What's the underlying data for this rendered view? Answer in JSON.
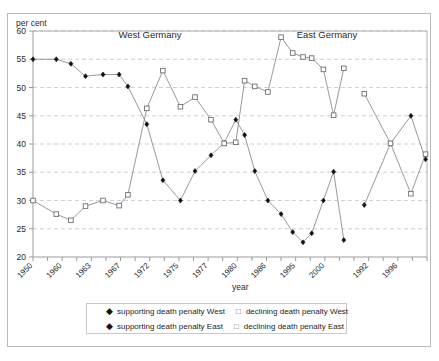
{
  "figure": {
    "y_unit_label": "per cent",
    "x_axis_title": "year",
    "panel_labels": [
      {
        "text": "West Germany",
        "x": 150,
        "y": 38
      },
      {
        "text": "East Germany",
        "x": 327,
        "y": 38
      }
    ]
  },
  "legend": {
    "rows": [
      [
        {
          "marker": "filled-diamond",
          "label": "supporting death penalty West"
        },
        {
          "marker": "open-square",
          "label": "declining death penalty West"
        }
      ],
      [
        {
          "marker": "filled-diamond",
          "label": "supporting death penalty East"
        },
        {
          "marker": "open-square",
          "label": "declining death penalty East"
        }
      ]
    ]
  },
  "colors": {
    "frame": "#b9b9b9",
    "axis": "#9a9a9a",
    "grid": "#b9c4d6",
    "line": "#8d8d8d",
    "filled_marker": "#111111",
    "open_marker_stroke": "#6f6f6f",
    "text": "#2b2b2b"
  },
  "chart_data": {
    "type": "line",
    "title": "",
    "xlabel": "year",
    "ylabel": "per cent",
    "ylim": [
      20,
      60
    ],
    "ytick_values": [
      20,
      25,
      30,
      35,
      40,
      45,
      50,
      55,
      60
    ],
    "grid": true,
    "legend_position": "bottom",
    "xtick_labels": [
      "1950",
      "1960",
      "1963",
      "1967",
      "1972",
      "1975",
      "1977",
      "1980",
      "1986",
      "1995",
      "2000",
      "1992",
      "1996"
    ],
    "xtick_slots": [
      0,
      2,
      4,
      6,
      8,
      10,
      12,
      14,
      16,
      18,
      20,
      23,
      25
    ],
    "n_slots": 28,
    "panel_split_slot": 21.5,
    "series": [
      {
        "name": "supporting death penalty West",
        "marker": "filled-diamond",
        "points": [
          {
            "slot": 0,
            "x": "1950",
            "y": 55
          },
          {
            "slot": 1.6,
            "x": "1958",
            "y": 55
          },
          {
            "slot": 2.6,
            "x": "1962",
            "y": 54.2
          },
          {
            "slot": 3.6,
            "x": "1964",
            "y": 52
          },
          {
            "slot": 4.8,
            "x": "1966",
            "y": 52.3
          },
          {
            "slot": 5.9,
            "x": "1967",
            "y": 52.3
          },
          {
            "slot": 6.5,
            "x": "1969",
            "y": 50.2
          },
          {
            "slot": 7.8,
            "x": "1971",
            "y": 43.5
          },
          {
            "slot": 8.9,
            "x": "1973",
            "y": 33.6
          },
          {
            "slot": 10.1,
            "x": "1975",
            "y": 30
          },
          {
            "slot": 11.1,
            "x": "1976",
            "y": 35.2
          },
          {
            "slot": 12.2,
            "x": "1977",
            "y": 38
          },
          {
            "slot": 13.1,
            "x": "1979",
            "y": 40.2
          },
          {
            "slot": 13.9,
            "x": "1980",
            "y": 44.3
          },
          {
            "slot": 14.5,
            "x": "1982",
            "y": 41.6
          },
          {
            "slot": 15.2,
            "x": "1984",
            "y": 35.2
          },
          {
            "slot": 16.1,
            "x": "1986",
            "y": 30
          },
          {
            "slot": 17.0,
            "x": "1989",
            "y": 27.6
          },
          {
            "slot": 17.8,
            "x": "1992",
            "y": 24.4
          },
          {
            "slot": 18.5,
            "x": "1995",
            "y": 22.6
          },
          {
            "slot": 19.1,
            "x": "1997",
            "y": 24.2
          },
          {
            "slot": 19.9,
            "x": "1998",
            "y": 30
          },
          {
            "slot": 20.6,
            "x": "2000",
            "y": 35.1
          },
          {
            "slot": 21.3,
            "x": "2002",
            "y": 23
          }
        ]
      },
      {
        "name": "declining death penalty West",
        "marker": "open-square",
        "points": [
          {
            "slot": 0,
            "x": "1950",
            "y": 30
          },
          {
            "slot": 1.6,
            "x": "1958",
            "y": 27.6
          },
          {
            "slot": 2.6,
            "x": "1962",
            "y": 26.5
          },
          {
            "slot": 3.6,
            "x": "1964",
            "y": 29
          },
          {
            "slot": 4.8,
            "x": "1966",
            "y": 30
          },
          {
            "slot": 5.9,
            "x": "1967",
            "y": 29.1
          },
          {
            "slot": 6.5,
            "x": "1969",
            "y": 31
          },
          {
            "slot": 7.8,
            "x": "1971",
            "y": 46.3
          },
          {
            "slot": 8.9,
            "x": "1973",
            "y": 53
          },
          {
            "slot": 10.1,
            "x": "1975",
            "y": 46.6
          },
          {
            "slot": 11.1,
            "x": "1976",
            "y": 48.3
          },
          {
            "slot": 12.2,
            "x": "1977",
            "y": 44.3
          },
          {
            "slot": 13.1,
            "x": "1979",
            "y": 40.1
          },
          {
            "slot": 13.9,
            "x": "1980",
            "y": 40.3
          },
          {
            "slot": 14.5,
            "x": "1982",
            "y": 51.2
          },
          {
            "slot": 15.2,
            "x": "1984",
            "y": 50.2
          },
          {
            "slot": 16.1,
            "x": "1986",
            "y": 49.2
          },
          {
            "slot": 17.0,
            "x": "1989",
            "y": 58.9
          },
          {
            "slot": 17.8,
            "x": "1992",
            "y": 56.1
          },
          {
            "slot": 18.5,
            "x": "1995",
            "y": 55.4
          },
          {
            "slot": 19.1,
            "x": "1997",
            "y": 55.2
          },
          {
            "slot": 19.9,
            "x": "1998",
            "y": 53.2
          },
          {
            "slot": 20.6,
            "x": "2000",
            "y": 45.1
          },
          {
            "slot": 21.3,
            "x": "2002",
            "y": 53.4
          }
        ]
      },
      {
        "name": "supporting death penalty East",
        "marker": "filled-diamond",
        "points": [
          {
            "slot": 22.7,
            "x": "1992",
            "y": 29.2
          },
          {
            "slot": 24.5,
            "x": "1995",
            "y": 40.1
          },
          {
            "slot": 25.9,
            "x": "1996",
            "y": 45
          },
          {
            "slot": 26.9,
            "x": "1998",
            "y": 37.3
          }
        ]
      },
      {
        "name": "declining death penalty East",
        "marker": "open-square",
        "points": [
          {
            "slot": 22.7,
            "x": "1992",
            "y": 48.9
          },
          {
            "slot": 24.5,
            "x": "1995",
            "y": 40.1
          },
          {
            "slot": 25.9,
            "x": "1996",
            "y": 31.2
          },
          {
            "slot": 26.9,
            "x": "1998",
            "y": 38.2
          }
        ]
      }
    ]
  }
}
